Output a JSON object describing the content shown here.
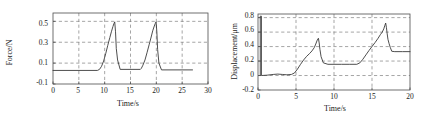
{
  "figure": {
    "panels": [
      "force-vs-time",
      "displacement-vs-time"
    ]
  },
  "chart_data": [
    {
      "type": "line",
      "name": "force-vs-time",
      "title": "",
      "xlabel": "Time/s",
      "ylabel": "Force/N",
      "xlim": [
        0,
        30
      ],
      "ylim": [
        -0.1,
        0.58
      ],
      "xticks": [
        0,
        5,
        10,
        15,
        20,
        25,
        30
      ],
      "xticklabels": [
        "0",
        "5",
        "10",
        "15",
        "20",
        "25",
        "30"
      ],
      "yticks": [
        -0.1,
        0.1,
        0.3,
        0.5
      ],
      "yticklabels": [
        "-0.1",
        "0.1",
        "0.3",
        "0.5"
      ],
      "grid": true,
      "grid_style": "dashed",
      "legend": "none",
      "series": [
        {
          "name": "force",
          "x": [
            0.0,
            8.6,
            9.0,
            9.4,
            9.8,
            10.2,
            10.6,
            11.0,
            11.3,
            11.6,
            11.8,
            11.95,
            12.1,
            12.25,
            12.5,
            13.0,
            16.9,
            17.1,
            17.4,
            17.8,
            18.2,
            18.6,
            19.0,
            19.3,
            19.6,
            19.8,
            19.95,
            20.1,
            20.25,
            20.5,
            21.0,
            27.0
          ],
          "y": [
            0.03,
            0.03,
            0.04,
            0.07,
            0.12,
            0.19,
            0.27,
            0.345,
            0.4,
            0.45,
            0.48,
            0.495,
            0.4,
            0.24,
            0.13,
            0.04,
            0.04,
            0.05,
            0.08,
            0.13,
            0.2,
            0.275,
            0.35,
            0.41,
            0.455,
            0.48,
            0.495,
            0.4,
            0.23,
            0.1,
            0.035,
            0.035
          ]
        }
      ]
    },
    {
      "type": "line",
      "name": "displacement-vs-time",
      "title": "",
      "xlabel": "Time/s",
      "ylabel": "Displacement/μm",
      "xlim": [
        0,
        20
      ],
      "ylim": [
        -0.2,
        0.85
      ],
      "xticks": [
        0,
        5,
        10,
        15,
        20
      ],
      "xticklabels": [
        "0",
        "5",
        "10",
        "15",
        "20"
      ],
      "yticks": [
        -0.2,
        0,
        0.2,
        0.4,
        0.6,
        0.8
      ],
      "yticklabels": [
        "-0.2",
        "0",
        "0.2",
        "0.4",
        "0.6",
        "0.8"
      ],
      "grid": true,
      "grid_style": "dashed",
      "legend": "none",
      "series": [
        {
          "name": "displacement",
          "x": [
            0.3,
            0.3,
            0.45,
            0.45,
            1.2,
            2.0,
            2.6,
            3.2,
            3.8,
            4.4,
            4.8,
            5.2,
            5.6,
            6.0,
            6.4,
            6.8,
            7.1,
            7.4,
            7.6,
            7.8,
            7.95,
            8.05,
            8.15,
            8.3,
            8.6,
            9.2,
            10.0,
            11.0,
            12.0,
            13.0,
            13.4,
            13.8,
            14.2,
            14.6,
            15.0,
            15.4,
            15.8,
            16.1,
            16.35,
            16.55,
            16.7,
            16.8,
            16.9,
            17.0,
            17.1,
            17.25,
            17.4,
            17.6,
            18.0,
            19.0,
            20.0
          ],
          "y": [
            0.0,
            0.82,
            0.82,
            0.0,
            0.005,
            0.015,
            0.02,
            0.015,
            0.01,
            0.015,
            0.035,
            0.09,
            0.155,
            0.215,
            0.265,
            0.305,
            0.34,
            0.385,
            0.435,
            0.49,
            0.515,
            0.45,
            0.36,
            0.26,
            0.175,
            0.155,
            0.155,
            0.155,
            0.155,
            0.155,
            0.175,
            0.225,
            0.285,
            0.345,
            0.4,
            0.455,
            0.515,
            0.565,
            0.6,
            0.645,
            0.695,
            0.725,
            0.66,
            0.575,
            0.5,
            0.44,
            0.39,
            0.335,
            0.33,
            0.33,
            0.33
          ]
        }
      ]
    }
  ]
}
